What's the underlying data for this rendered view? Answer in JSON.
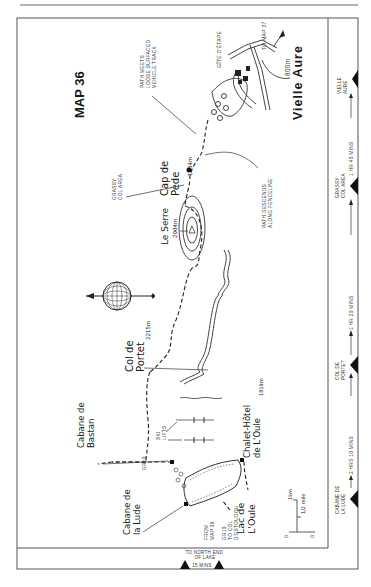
{
  "page": {
    "map_title": "MAP 36"
  },
  "places": {
    "vielle_aure": {
      "name": "Vielle Aure",
      "elevation": "800m"
    },
    "to_map_37": "TO MAP 37",
    "gite_detape": "GÎTE D'ÉTAPE",
    "path_meets_track": "PATH MEETS LOOSE SURFACED VEHICLE TRACK",
    "cap_de_pede": {
      "name_line1": "Cap de",
      "name_line2": "Pède",
      "elevation": "1634m"
    },
    "grassy_col_area": "GRASSY COL AREA",
    "path_descends": "PATH DESCENDS ALONG FENCELINE",
    "le_serre": {
      "name": "Le Serre",
      "elevation": "2004m"
    },
    "col_de_portet": {
      "name_line1": "Col de",
      "name_line2": "Portet",
      "elevation": "2215m"
    },
    "ski_lifts": "SKI LIFTS",
    "gr10": "GR10",
    "cabane_de_bastan": {
      "line1": "Cabane de",
      "line2": "Bastan"
    },
    "cabane_de_la_lude": {
      "line1": "Cabane de",
      "line2": "la Lude"
    },
    "chalet_hotel": {
      "line1": "Chalet-Hôtel",
      "line2": "de L'Oule",
      "elevation": "1819m"
    },
    "lac_de_loule": {
      "line1": "Lac de",
      "line2": "L'Oule"
    },
    "from_map_35": "FROM MAP 35",
    "gr10_to_col": "GR10 TO COL D'ESTOUDOU"
  },
  "scale": {
    "km_label": "1km",
    "mile_label": "1/2 mile",
    "zero": "0"
  },
  "route_profile": {
    "waypoints": [
      {
        "label": "VIELLE AURE"
      },
      {
        "label": "GRASSY COL AREA"
      },
      {
        "label": "COL DE PORTET"
      },
      {
        "label": "CABANE DE LA LUDE"
      }
    ],
    "segments": [
      {
        "label": "1 HR 40 MINS"
      },
      {
        "label": "1 HR 20 MINS"
      },
      {
        "label": "2 HRS 10 MINS"
      }
    ]
  },
  "bottom_strip": {
    "label": "TO NORTH END OF LAKE",
    "duration": "15 MINS"
  },
  "colors": {
    "ink": "#1a1a1a",
    "frame": "#555555",
    "paper": "#ffffff"
  }
}
